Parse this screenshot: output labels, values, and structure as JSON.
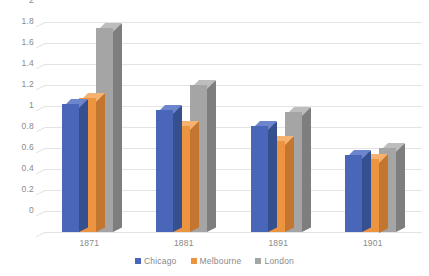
{
  "chart_data": {
    "type": "bar",
    "title": "",
    "subtitle": "",
    "xlabel": "",
    "ylabel": "",
    "categories": [
      "1871",
      "1881",
      "1891",
      "1901"
    ],
    "series": [
      {
        "name": "Chicago",
        "color": "#4A66B8",
        "values": [
          1.22,
          1.16,
          1.01,
          0.73
        ]
      },
      {
        "name": "Melbourne",
        "color": "#ED9440",
        "values": [
          1.28,
          1.01,
          0.87,
          0.7
        ]
      },
      {
        "name": "London",
        "color": "#A5A5A5",
        "values": [
          1.94,
          1.4,
          1.14,
          0.8
        ]
      }
    ],
    "ylim": [
      0,
      2
    ],
    "ystep": 0.2,
    "yticks": [
      "0",
      "0.2",
      "0.4",
      "0.6",
      "0.8",
      "1",
      "1.2",
      "1.4",
      "1.6",
      "1.8",
      "2"
    ],
    "ytick_values": [
      0,
      0.2,
      0.4,
      0.6,
      0.8,
      1,
      1.2,
      1.4,
      1.6,
      1.8,
      2
    ],
    "grid": "horizontal",
    "legend_position": "bottom",
    "style": "3d-clustered-column",
    "background_color": "#FFFFFF",
    "gridline_color": "#E4E4E4",
    "text_color": "#8A8A8A"
  },
  "legend": {
    "items": [
      {
        "label": "Chicago"
      },
      {
        "label": "Melbourne"
      },
      {
        "label": "London"
      }
    ]
  }
}
